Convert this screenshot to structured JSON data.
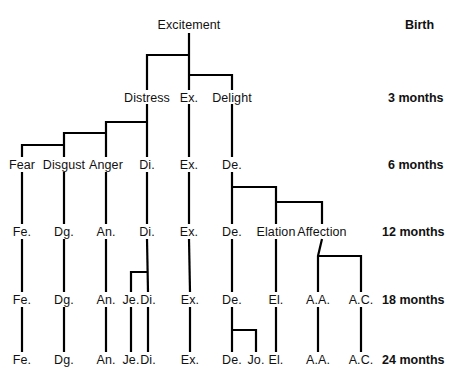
{
  "diagram": {
    "type": "hierarchy-tree",
    "line_color": "#000000",
    "text_color": "#111111",
    "background": "#ffffff",
    "rows": [
      {
        "id": "birth",
        "label": "Birth",
        "y": 25,
        "label_x": 405
      },
      {
        "id": "m3",
        "label": "3 months",
        "y": 98,
        "label_x": 388
      },
      {
        "id": "m6",
        "label": "6 months",
        "y": 165,
        "label_x": 388
      },
      {
        "id": "m12",
        "label": "12 months",
        "y": 232,
        "label_x": 382
      },
      {
        "id": "m18",
        "label": "18 months",
        "y": 300,
        "label_x": 382
      },
      {
        "id": "m24",
        "label": "24 months",
        "y": 360,
        "label_x": 382
      }
    ],
    "nodes": [
      {
        "id": "excitement-birth",
        "label": "Excitement",
        "x": 189,
        "y": 25,
        "row": "birth"
      },
      {
        "id": "distress-m3",
        "label": "Distress",
        "x": 147,
        "y": 98,
        "row": "m3"
      },
      {
        "id": "ex-m3",
        "label": "Ex.",
        "x": 189,
        "y": 98,
        "row": "m3"
      },
      {
        "id": "delight-m3",
        "label": "Delight",
        "x": 232,
        "y": 98,
        "row": "m3"
      },
      {
        "id": "fear-m6",
        "label": "Fear",
        "x": 22,
        "y": 165,
        "row": "m6"
      },
      {
        "id": "disgust-m6",
        "label": "Disgust",
        "x": 64,
        "y": 165,
        "row": "m6"
      },
      {
        "id": "anger-m6",
        "label": "Anger",
        "x": 106,
        "y": 165,
        "row": "m6"
      },
      {
        "id": "di-m6",
        "label": "Di.",
        "x": 147,
        "y": 165,
        "row": "m6"
      },
      {
        "id": "ex-m6",
        "label": "Ex.",
        "x": 189,
        "y": 165,
        "row": "m6"
      },
      {
        "id": "de-m6",
        "label": "De.",
        "x": 232,
        "y": 165,
        "row": "m6"
      },
      {
        "id": "fe-m12",
        "label": "Fe.",
        "x": 22,
        "y": 232,
        "row": "m12"
      },
      {
        "id": "dg-m12",
        "label": "Dg.",
        "x": 64,
        "y": 232,
        "row": "m12"
      },
      {
        "id": "an-m12",
        "label": "An.",
        "x": 106,
        "y": 232,
        "row": "m12"
      },
      {
        "id": "di-m12",
        "label": "Di.",
        "x": 147,
        "y": 232,
        "row": "m12"
      },
      {
        "id": "ex-m12",
        "label": "Ex.",
        "x": 189,
        "y": 232,
        "row": "m12"
      },
      {
        "id": "de-m12",
        "label": "De.",
        "x": 232,
        "y": 232,
        "row": "m12"
      },
      {
        "id": "elation-m12",
        "label": "Elation",
        "x": 276,
        "y": 232,
        "row": "m12"
      },
      {
        "id": "affection-m12",
        "label": "Affection",
        "x": 322,
        "y": 232,
        "row": "m12"
      },
      {
        "id": "fe-m18",
        "label": "Fe.",
        "x": 22,
        "y": 300,
        "row": "m18"
      },
      {
        "id": "dg-m18",
        "label": "Dg.",
        "x": 64,
        "y": 300,
        "row": "m18"
      },
      {
        "id": "an-m18",
        "label": "An.",
        "x": 106,
        "y": 300,
        "row": "m18"
      },
      {
        "id": "je-m18",
        "label": "Je.",
        "x": 131,
        "y": 300,
        "row": "m18"
      },
      {
        "id": "di-m18",
        "label": "Di.",
        "x": 148,
        "y": 300,
        "row": "m18"
      },
      {
        "id": "ex-m18",
        "label": "Ex.",
        "x": 190,
        "y": 300,
        "row": "m18"
      },
      {
        "id": "de-m18",
        "label": "De.",
        "x": 232,
        "y": 300,
        "row": "m18"
      },
      {
        "id": "el-m18",
        "label": "El.",
        "x": 276,
        "y": 300,
        "row": "m18"
      },
      {
        "id": "aa-m18",
        "label": "A.A.",
        "x": 318,
        "y": 300,
        "row": "m18"
      },
      {
        "id": "ac-m18",
        "label": "A.C.",
        "x": 361,
        "y": 300,
        "row": "m18"
      },
      {
        "id": "fe-m24",
        "label": "Fe.",
        "x": 22,
        "y": 360,
        "row": "m24"
      },
      {
        "id": "dg-m24",
        "label": "Dg.",
        "x": 64,
        "y": 360,
        "row": "m24"
      },
      {
        "id": "an-m24",
        "label": "An.",
        "x": 106,
        "y": 360,
        "row": "m24"
      },
      {
        "id": "je-m24",
        "label": "Je.",
        "x": 131,
        "y": 360,
        "row": "m24"
      },
      {
        "id": "di-m24",
        "label": "Di.",
        "x": 148,
        "y": 360,
        "row": "m24"
      },
      {
        "id": "ex-m24",
        "label": "Ex.",
        "x": 190,
        "y": 360,
        "row": "m24"
      },
      {
        "id": "de-m24",
        "label": "De.",
        "x": 232,
        "y": 360,
        "row": "m24"
      },
      {
        "id": "jo-m24",
        "label": "Jo.",
        "x": 256,
        "y": 360,
        "row": "m24"
      },
      {
        "id": "el-m24",
        "label": "El.",
        "x": 276,
        "y": 360,
        "row": "m24"
      },
      {
        "id": "aa-m24",
        "label": "A.A.",
        "x": 318,
        "y": 360,
        "row": "m24"
      },
      {
        "id": "ac-m24",
        "label": "A.C.",
        "x": 361,
        "y": 360,
        "row": "m24"
      }
    ],
    "edges": [
      {
        "id": "excitement-trunk",
        "points": "189,33 189,90"
      },
      {
        "id": "excitement-to-distress",
        "points": "189,55 147,55 147,90"
      },
      {
        "id": "excitement-to-delight",
        "points": "189,75 232,75 232,90"
      },
      {
        "id": "distress-trunk",
        "points": "147,104 147,157"
      },
      {
        "id": "distress-to-anger",
        "points": "147,122 106,122 106,157"
      },
      {
        "id": "anger-to-disgust",
        "points": "106,133 64,133 64,157"
      },
      {
        "id": "disgust-to-fear",
        "points": "64,145 22,145 22,157"
      },
      {
        "id": "ex-m3-trunk",
        "points": "189,104 189,157"
      },
      {
        "id": "delight-trunk",
        "points": "232,104 232,157"
      },
      {
        "id": "fear-m6-trunk",
        "points": "22,172 22,224"
      },
      {
        "id": "disgust-m6-trunk",
        "points": "64,172 64,224"
      },
      {
        "id": "anger-m6-trunk",
        "points": "106,172 106,224"
      },
      {
        "id": "di-m6-trunk",
        "points": "147,172 147,224"
      },
      {
        "id": "ex-m6-trunk",
        "points": "189,172 189,224"
      },
      {
        "id": "de-m6-trunk",
        "points": "232,172 232,224"
      },
      {
        "id": "de-to-elation",
        "points": "232,187 276,187 276,224"
      },
      {
        "id": "elation-to-affection",
        "points": "276,202 322,202 322,224"
      },
      {
        "id": "fe-m12-trunk",
        "points": "22,239 22,292"
      },
      {
        "id": "dg-m12-trunk",
        "points": "64,239 64,292"
      },
      {
        "id": "an-m12-trunk",
        "points": "106,239 106,292"
      },
      {
        "id": "di-m12-trunk",
        "points": "147,239 148,292"
      },
      {
        "id": "di-to-je",
        "points": "148,272 131,272 131,292"
      },
      {
        "id": "ex-m12-trunk",
        "points": "189,239 190,292"
      },
      {
        "id": "de-m12-trunk",
        "points": "232,239 232,292"
      },
      {
        "id": "elation-m12-trunk",
        "points": "276,239 276,292"
      },
      {
        "id": "affection-m12-trunk",
        "points": "322,239 318,256 318,292"
      },
      {
        "id": "affection-to-ac",
        "points": "318,256 361,256 361,292"
      },
      {
        "id": "fe-m18-trunk",
        "points": "22,307 22,352"
      },
      {
        "id": "dg-m18-trunk",
        "points": "64,307 64,352"
      },
      {
        "id": "an-m18-trunk",
        "points": "106,307 106,352"
      },
      {
        "id": "je-m18-trunk",
        "points": "131,307 131,352"
      },
      {
        "id": "di-m18-trunk",
        "points": "148,307 148,352"
      },
      {
        "id": "ex-m18-trunk",
        "points": "190,307 190,352"
      },
      {
        "id": "de-m18-trunk",
        "points": "232,307 232,352"
      },
      {
        "id": "de-to-jo",
        "points": "232,330 256,330 256,352"
      },
      {
        "id": "el-m18-trunk",
        "points": "276,307 276,352"
      },
      {
        "id": "aa-m18-trunk",
        "points": "318,307 318,352"
      },
      {
        "id": "ac-m18-trunk",
        "points": "361,307 361,352"
      }
    ]
  }
}
